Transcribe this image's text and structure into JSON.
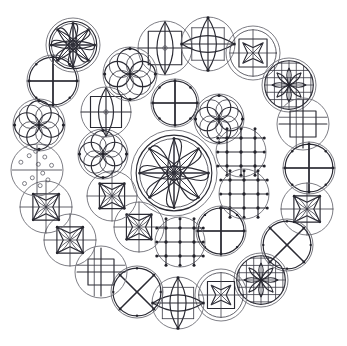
{
  "figure": {
    "width": 347,
    "height": 346,
    "background_color": "#ffffff",
    "outline_color": "#6e6e76",
    "ink_color": "#2a2a33",
    "node_color": "#22222a",
    "glyph_count": 31,
    "layout": "concentric-radial",
    "center": {
      "x": 174,
      "y": 173
    }
  },
  "rings": [
    {
      "name": "center",
      "radius": 0,
      "count": 1
    },
    {
      "name": "inner-ring",
      "radius": 64,
      "count": 8
    },
    {
      "name": "middle-ring",
      "radius": 108,
      "count": 10
    },
    {
      "name": "outer-ring",
      "radius": 143,
      "count": 12
    }
  ],
  "glyph_types": [
    {
      "id": "rosette8",
      "label": "eight-petal-rosette"
    },
    {
      "id": "star4",
      "label": "four-point-star"
    },
    {
      "id": "pinwheel",
      "label": "pinwheel-spiral"
    },
    {
      "id": "quatrefoil",
      "label": "quatrefoil-four-circles"
    },
    {
      "id": "lens-square",
      "label": "lens-cross-square"
    },
    {
      "id": "grid3",
      "label": "grid-with-nodes"
    },
    {
      "id": "square-in-circle",
      "label": "square-in-circle"
    },
    {
      "id": "hatched-rosette",
      "label": "hatched-rosette"
    },
    {
      "id": "dotscatter",
      "label": "scattered-dots"
    },
    {
      "id": "fan",
      "label": "radial-fan"
    },
    {
      "id": "lozenge",
      "label": "lozenge-cross"
    },
    {
      "id": "star-in-square",
      "label": "star-inscribed-square"
    }
  ],
  "glyphs": [
    {
      "i": 0,
      "name": "glyph-center-rosette",
      "type": "rosette8",
      "cx": 174,
      "cy": 173,
      "r": 43,
      "rot": 0,
      "ring": "center"
    },
    {
      "i": 1,
      "name": "glyph-inner-pinwheel-n",
      "type": "pinwheel",
      "cx": 175,
      "cy": 103,
      "r": 24,
      "rot": 0,
      "ring": "inner-ring"
    },
    {
      "i": 2,
      "name": "glyph-inner-quatrefoil-ne",
      "type": "quatrefoil",
      "cx": 219,
      "cy": 119,
      "r": 25,
      "rot": 0,
      "ring": "inner-ring"
    },
    {
      "i": 3,
      "name": "glyph-inner-grid-e-upper",
      "type": "grid3",
      "cx": 241,
      "cy": 152,
      "r": 25,
      "rot": 0,
      "ring": "inner-ring"
    },
    {
      "i": 4,
      "name": "glyph-inner-grid-e-lower",
      "type": "grid3",
      "cx": 244,
      "cy": 194,
      "r": 25,
      "rot": 0,
      "ring": "inner-ring"
    },
    {
      "i": 5,
      "name": "glyph-inner-pinwheel-se",
      "type": "pinwheel",
      "cx": 221,
      "cy": 231,
      "r": 25,
      "rot": 180,
      "ring": "inner-ring"
    },
    {
      "i": 6,
      "name": "glyph-inner-grid-s",
      "type": "grid3",
      "cx": 180,
      "cy": 242,
      "r": 25,
      "rot": 0,
      "ring": "inner-ring"
    },
    {
      "i": 7,
      "name": "glyph-inner-star-sw",
      "type": "star4",
      "cx": 139,
      "cy": 227,
      "r": 25,
      "rot": 0,
      "ring": "inner-ring"
    },
    {
      "i": 8,
      "name": "glyph-inner-star-w-lower",
      "type": "star4",
      "cx": 112,
      "cy": 196,
      "r": 25,
      "rot": 0,
      "ring": "inner-ring"
    },
    {
      "i": 9,
      "name": "glyph-inner-quatrefoil-w",
      "type": "quatrefoil",
      "cx": 103,
      "cy": 154,
      "r": 25,
      "rot": 0,
      "ring": "inner-ring"
    },
    {
      "i": 10,
      "name": "glyph-inner-lens-nw",
      "type": "lens-square",
      "cx": 106,
      "cy": 112,
      "r": 25,
      "rot": 0,
      "ring": "inner-ring"
    },
    {
      "i": 11,
      "name": "glyph-mid-lens-n",
      "type": "lens-square",
      "cx": 165,
      "cy": 48,
      "r": 27,
      "rot": 0,
      "ring": "middle-ring"
    },
    {
      "i": 12,
      "name": "glyph-mid-lozenge-nne",
      "type": "lozenge",
      "cx": 208,
      "cy": 44,
      "r": 27,
      "rot": 0,
      "ring": "middle-ring"
    },
    {
      "i": 13,
      "name": "glyph-mid-starsq-ne",
      "type": "star-in-square",
      "cx": 253,
      "cy": 53,
      "r": 27,
      "rot": 0,
      "ring": "middle-ring"
    },
    {
      "i": 14,
      "name": "glyph-mid-hatched-ene",
      "type": "hatched-rosette",
      "cx": 289,
      "cy": 85,
      "r": 27,
      "rot": 0,
      "ring": "middle-ring"
    },
    {
      "i": 15,
      "name": "glyph-mid-squarecircle-e",
      "type": "square-in-circle",
      "cx": 303,
      "cy": 124,
      "r": 26,
      "rot": 0,
      "ring": "middle-ring"
    },
    {
      "i": 16,
      "name": "glyph-mid-pinwheel-e",
      "type": "pinwheel",
      "cx": 309,
      "cy": 168,
      "r": 26,
      "rot": 90,
      "ring": "middle-ring"
    },
    {
      "i": 17,
      "name": "glyph-mid-star-ese",
      "type": "star4",
      "cx": 307,
      "cy": 209,
      "r": 26,
      "rot": 0,
      "ring": "middle-ring"
    },
    {
      "i": 18,
      "name": "glyph-mid-pinwheel-se",
      "type": "pinwheel",
      "cx": 287,
      "cy": 245,
      "r": 26,
      "rot": 45,
      "ring": "middle-ring"
    },
    {
      "i": 19,
      "name": "glyph-mid-hatched-s",
      "type": "hatched-rosette",
      "cx": 261,
      "cy": 280,
      "r": 27,
      "rot": 0,
      "ring": "middle-ring"
    },
    {
      "i": 20,
      "name": "glyph-mid-starsq-ssw",
      "type": "star-in-square",
      "cx": 221,
      "cy": 295,
      "r": 26,
      "rot": 0,
      "ring": "middle-ring"
    },
    {
      "i": 21,
      "name": "glyph-mid-lozenge-s",
      "type": "lozenge",
      "cx": 178,
      "cy": 303,
      "r": 26,
      "rot": 0,
      "ring": "middle-ring"
    },
    {
      "i": 22,
      "name": "glyph-mid-pinwheel-ssw",
      "type": "pinwheel",
      "cx": 137,
      "cy": 292,
      "r": 26,
      "rot": 135,
      "ring": "middle-ring"
    },
    {
      "i": 23,
      "name": "glyph-outer-squarecircle-sw",
      "type": "square-in-circle",
      "cx": 101,
      "cy": 272,
      "r": 26,
      "rot": 0,
      "ring": "outer-ring"
    },
    {
      "i": 24,
      "name": "glyph-outer-star-wsw",
      "type": "star4",
      "cx": 70,
      "cy": 240,
      "r": 26,
      "rot": 0,
      "ring": "outer-ring"
    },
    {
      "i": 25,
      "name": "glyph-outer-star-w",
      "type": "star4",
      "cx": 46,
      "cy": 207,
      "r": 26,
      "rot": 0,
      "ring": "outer-ring"
    },
    {
      "i": 26,
      "name": "glyph-outer-dots-w",
      "type": "dotscatter",
      "cx": 37,
      "cy": 170,
      "r": 26,
      "rot": 0,
      "ring": "outer-ring"
    },
    {
      "i": 27,
      "name": "glyph-outer-quatrefoil-wnw",
      "type": "quatrefoil",
      "cx": 39,
      "cy": 125,
      "r": 26,
      "rot": 0,
      "ring": "outer-ring"
    },
    {
      "i": 28,
      "name": "glyph-outer-pinwheel-nw",
      "type": "pinwheel",
      "cx": 53,
      "cy": 81,
      "r": 26,
      "rot": 0,
      "ring": "outer-ring"
    },
    {
      "i": 29,
      "name": "glyph-outer-rosette-nnw",
      "type": "rosette8",
      "cx": 73,
      "cy": 45,
      "r": 27,
      "rot": 0,
      "ring": "outer-ring"
    },
    {
      "i": 30,
      "name": "glyph-outer-quatrefoil-nnw2",
      "type": "quatrefoil",
      "cx": 130,
      "cy": 74,
      "r": 27,
      "rot": 0,
      "ring": "outer-ring"
    },
    {
      "i": 31,
      "name": "glyph-outer-fan-sw",
      "type": "fan",
      "cx": 176,
      "cy": 173,
      "r": 0,
      "rot": 0,
      "ring": "hidden"
    }
  ]
}
